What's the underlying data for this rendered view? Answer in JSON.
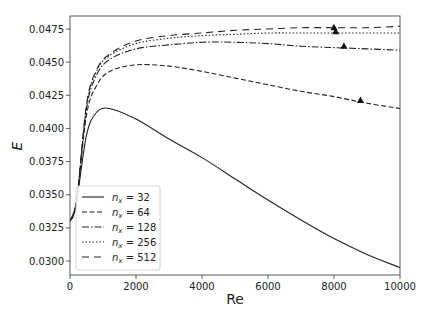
{
  "chart_data": {
    "type": "line",
    "title": "",
    "xlabel": "Re",
    "ylabel": "E",
    "xlim": [
      0,
      10000
    ],
    "ylim": [
      0.0285,
      0.0485
    ],
    "grid": false,
    "legend_position": "lower left",
    "x_ticks": [
      "0",
      "2000",
      "4000",
      "6000",
      "8000",
      "10000"
    ],
    "y_ticks": [
      "0.0300",
      "0.0325",
      "0.0350",
      "0.0375",
      "0.0400",
      "0.0425",
      "0.0450",
      "0.0475"
    ],
    "x": [
      0,
      200,
      500,
      800,
      1200,
      2000,
      3000,
      4000,
      5000,
      6000,
      7000,
      8000,
      9000,
      10000
    ],
    "series": [
      {
        "name": "n_x = 32",
        "label_base": "n",
        "label_sub": "x",
        "label_val": "= 32",
        "style": "solid",
        "values": [
          0.033,
          0.0345,
          0.0395,
          0.0412,
          0.0415,
          0.0407,
          0.0392,
          0.0378,
          0.0362,
          0.0346,
          0.0331,
          0.0317,
          0.0305,
          0.0295
        ]
      },
      {
        "name": "n_x = 64",
        "label_base": "n",
        "label_sub": "x",
        "label_val": "= 64",
        "style": "dashed",
        "values": [
          0.033,
          0.0345,
          0.041,
          0.0432,
          0.0443,
          0.0448,
          0.0447,
          0.0443,
          0.0438,
          0.0433,
          0.0428,
          0.0424,
          0.0419,
          0.0415
        ],
        "marker": {
          "x": 8800,
          "y": 0.0421
        }
      },
      {
        "name": "n_x = 128",
        "label_base": "n",
        "label_sub": "x",
        "label_val": "= 128",
        "style": "dashdot",
        "values": [
          0.033,
          0.0345,
          0.0415,
          0.044,
          0.0452,
          0.046,
          0.0463,
          0.0465,
          0.0465,
          0.0464,
          0.0462,
          0.0461,
          0.046,
          0.0459
        ],
        "marker": {
          "x": 8300,
          "y": 0.0462
        }
      },
      {
        "name": "n_x = 256",
        "label_base": "n",
        "label_sub": "x",
        "label_val": "= 256",
        "style": "dotted",
        "values": [
          0.033,
          0.0345,
          0.0417,
          0.0443,
          0.0455,
          0.0464,
          0.0468,
          0.047,
          0.0471,
          0.0472,
          0.0472,
          0.0472,
          0.0472,
          0.0472
        ],
        "marker": {
          "x": 8050,
          "y": 0.0473
        }
      },
      {
        "name": "n_x = 512",
        "label_base": "n",
        "label_sub": "x",
        "label_val": "= 512",
        "style": "loosely-dashed",
        "values": [
          0.033,
          0.0345,
          0.0418,
          0.0444,
          0.0456,
          0.0466,
          0.047,
          0.0472,
          0.0474,
          0.0475,
          0.0476,
          0.0476,
          0.0476,
          0.0477
        ],
        "marker": {
          "x": 8000,
          "y": 0.0476
        }
      }
    ]
  }
}
